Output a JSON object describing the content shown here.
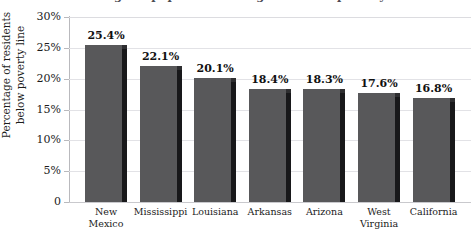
{
  "chart_data": {
    "type": "bar",
    "title": "Percentage of population living below the poverty line",
    "xlabel": "",
    "ylabel": "Percentage of residents\nbelow poverty line",
    "categories": [
      "New\nMexico",
      "Mississippi",
      "Louisiana",
      "Arkansas",
      "Arizona",
      "West\nVirginia",
      "California"
    ],
    "values": [
      25.4,
      22.1,
      20.1,
      18.4,
      18.3,
      17.6,
      16.8
    ],
    "value_labels": [
      "25.4%",
      "22.1%",
      "20.1%",
      "18.4%",
      "18.3%",
      "17.6%",
      "16.8%"
    ],
    "ylim": [
      0,
      30
    ],
    "yticks": [
      0,
      5,
      10,
      15,
      20,
      25,
      30
    ],
    "ytick_labels": [
      "0",
      "5%",
      "10%",
      "15%",
      "20%",
      "25%",
      "30%"
    ],
    "grid": true,
    "legend": "none",
    "bar_color": "#58585a",
    "bar_side_color": "#18181a",
    "gridline_color": "#e2e2e6",
    "axis_color": "#b9b9bd"
  }
}
